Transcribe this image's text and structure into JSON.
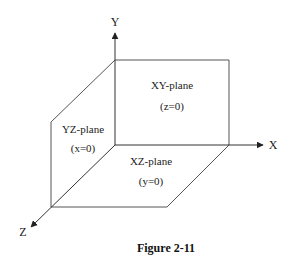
{
  "diagram": {
    "axes": {
      "x": "X",
      "y": "Y",
      "z": "Z"
    },
    "planes": [
      {
        "name": "XY-plane",
        "equation": "(z=0)"
      },
      {
        "name": "YZ-plane",
        "equation": "(x=0)"
      },
      {
        "name": "XZ-plane",
        "equation": "(y=0)"
      }
    ],
    "caption": "Figure 2-11",
    "colors": {
      "line": "#444444",
      "text": "#222222"
    }
  }
}
